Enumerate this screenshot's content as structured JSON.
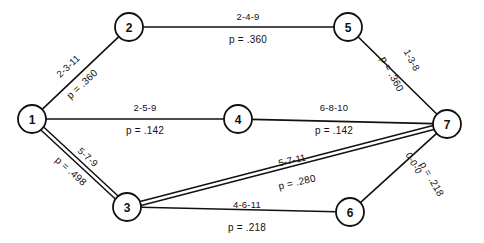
{
  "diagram": {
    "type": "pert-network",
    "nodes": [
      {
        "id": "1",
        "label": "1",
        "cx": 32,
        "cy": 119,
        "r": 14
      },
      {
        "id": "2",
        "label": "2",
        "cx": 129,
        "cy": 27,
        "r": 14
      },
      {
        "id": "3",
        "label": "3",
        "cx": 127,
        "cy": 207,
        "r": 14
      },
      {
        "id": "4",
        "label": "4",
        "cx": 238,
        "cy": 119,
        "r": 14
      },
      {
        "id": "5",
        "label": "5",
        "cx": 348,
        "cy": 27,
        "r": 14
      },
      {
        "id": "6",
        "label": "6",
        "cx": 350,
        "cy": 212,
        "r": 14
      },
      {
        "id": "7",
        "label": "7",
        "cx": 447,
        "cy": 124,
        "r": 14
      }
    ],
    "edges": [
      {
        "id": "edge-1-2",
        "from": "1",
        "to": "2",
        "estimate": "2-3-11",
        "probability": "p = .360",
        "style": "single",
        "estimate_x": 68,
        "estimate_y": 66,
        "estimate_rotate": -43,
        "prob_x": 82,
        "prob_y": 84,
        "prob_rotate": -43
      },
      {
        "id": "edge-2-5",
        "from": "2",
        "to": "5",
        "estimate": "2-4-9",
        "probability": "p = .360",
        "style": "single",
        "estimate_x": 248,
        "estimate_y": 16,
        "estimate_rotate": 0,
        "prob_x": 248,
        "prob_y": 39,
        "prob_rotate": 0
      },
      {
        "id": "edge-5-7",
        "from": "5",
        "to": "7",
        "estimate": "1-3-8",
        "probability": "p = .360",
        "style": "single",
        "estimate_x": 412,
        "estimate_y": 60,
        "estimate_rotate": 62,
        "prob_x": 392,
        "prob_y": 74,
        "prob_rotate": 62
      },
      {
        "id": "edge-1-4",
        "from": "1",
        "to": "4",
        "estimate": "2-5-9",
        "probability": "p = .142",
        "style": "single",
        "estimate_x": 145,
        "estimate_y": 107,
        "estimate_rotate": 0,
        "prob_x": 145,
        "prob_y": 130,
        "prob_rotate": 0
      },
      {
        "id": "edge-4-7",
        "from": "4",
        "to": "7",
        "estimate": "6-8-10",
        "probability": "p = .142",
        "style": "single",
        "estimate_x": 334,
        "estimate_y": 107,
        "estimate_rotate": 0,
        "prob_x": 334,
        "prob_y": 130,
        "prob_rotate": 0
      },
      {
        "id": "edge-1-3",
        "from": "1",
        "to": "3",
        "estimate": "5-7-9",
        "probability": "p = .498",
        "style": "double",
        "estimate_x": 88,
        "estimate_y": 157,
        "estimate_rotate": 42,
        "prob_x": 71,
        "prob_y": 171,
        "prob_rotate": 42
      },
      {
        "id": "edge-3-7",
        "from": "3",
        "to": "7",
        "estimate": "5-7-11",
        "probability": "p = .280",
        "style": "double",
        "estimate_x": 292,
        "estimate_y": 160,
        "estimate_rotate": -13,
        "prob_x": 297,
        "prob_y": 182,
        "prob_rotate": -13
      },
      {
        "id": "edge-3-6",
        "from": "3",
        "to": "6",
        "estimate": "4-6-11",
        "probability": "p = .218",
        "style": "single",
        "estimate_x": 247,
        "estimate_y": 204,
        "estimate_rotate": 0,
        "prob_x": 247,
        "prob_y": 227,
        "prob_rotate": 0
      },
      {
        "id": "edge-6-7",
        "from": "6",
        "to": "7",
        "estimate": "0-0-0",
        "probability": "p = .218",
        "style": "single",
        "estimate_x": 414,
        "estimate_y": 163,
        "estimate_rotate": 60,
        "prob_x": 432,
        "prob_y": 179,
        "prob_rotate": 60
      }
    ],
    "colors": {
      "stroke": "#111111",
      "node_fill": "#ffffff",
      "background": "#ffffff",
      "text": "#111111"
    }
  }
}
